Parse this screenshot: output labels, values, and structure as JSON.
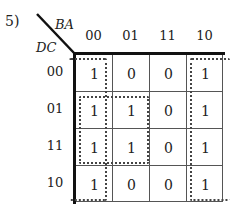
{
  "problem_number": "5)",
  "axis": {
    "column_vars": "BA",
    "row_vars": "DC"
  },
  "columns": [
    "00",
    "01",
    "11",
    "10"
  ],
  "rows": [
    "00",
    "01",
    "11",
    "10"
  ],
  "cells": [
    [
      "1",
      "0",
      "0",
      "1"
    ],
    [
      "1",
      "1",
      "0",
      "1"
    ],
    [
      "1",
      "1",
      "0",
      "1"
    ],
    [
      "1",
      "0",
      "0",
      "1"
    ]
  ],
  "groupings": [
    {
      "name": "column-00-wrap",
      "cells": "column 00 (all rows), wraps with column 10"
    },
    {
      "name": "column-10-wrap",
      "cells": "column 10 (all rows), wraps with column 00"
    },
    {
      "name": "quad-center-left",
      "cells": "rows 01-11, columns 00-01"
    }
  ]
}
